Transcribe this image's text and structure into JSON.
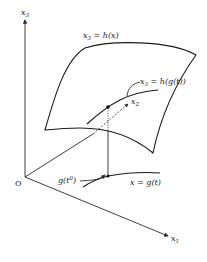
{
  "diagram": {
    "axes": {
      "origin_label": "O",
      "x1": {
        "base": "x",
        "sub": "1"
      },
      "x2": {
        "base": "x",
        "sub": "2"
      },
      "x3": {
        "base": "x",
        "sub": "3"
      }
    },
    "surface_label": {
      "lhs_base": "x",
      "lhs_sub": "3",
      "rhs": " = h(x)"
    },
    "surface_curve_label": {
      "lhs_base": "x",
      "lhs_sub": "3",
      "rhs": " = h(g(t))"
    },
    "base_curve_label": "x = g(t)",
    "initial_point_label": {
      "base": "g(t",
      "sup": "0",
      "close": ")"
    }
  }
}
